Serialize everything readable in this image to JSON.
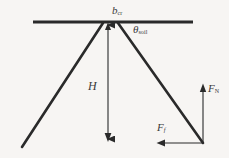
{
  "figure": {
    "background_color": "#f7f5f3",
    "line_color": "#2a2a2a",
    "label_color": "#3a3a3a",
    "labels": {
      "breach_width": {
        "symbol": "b",
        "subscript": "cr",
        "name": "critical-breach-width"
      },
      "angle": {
        "symbol": "θ",
        "subscript": "soil",
        "name": "soil-internal-friction-angle"
      },
      "depth": {
        "symbol": "H",
        "subscript": "",
        "name": "scour-depth"
      },
      "normal_force": {
        "symbol": "F",
        "subscript": "N",
        "name": "normal-force"
      },
      "friction_force": {
        "symbol": "F",
        "subscript": "f",
        "name": "friction-force"
      }
    },
    "geometry": {
      "ground_line": {
        "x1": 33,
        "y1": 22,
        "x2": 193,
        "y2": 22
      },
      "left_slope": {
        "x1": 103,
        "y1": 23,
        "x2": 22,
        "y2": 147
      },
      "right_slope": {
        "x1": 118,
        "y1": 23,
        "x2": 203,
        "y2": 143
      },
      "depth_arrow": {
        "x": 108,
        "y_top": 23,
        "y_bottom": 141,
        "double_headed": true
      },
      "normal_force_arrow": {
        "x": 203,
        "y_tail": 143,
        "y_head": 84,
        "direction": "up"
      },
      "friction_force_arrow": {
        "y": 143,
        "x_tail": 203,
        "x_head": 157,
        "direction": "left"
      }
    }
  }
}
